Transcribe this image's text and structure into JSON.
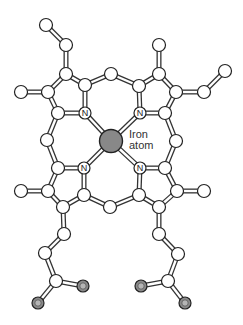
{
  "labels": {
    "iron_line1": "Iron",
    "iron_line2": "atom",
    "nitrogen": "N"
  },
  "colors": {
    "bond_outline": "#333333",
    "bond_fill": "#ffffff",
    "atom_fill": "#ffffff",
    "atom_stroke": "#222222",
    "iron_fill": "#888888",
    "oxygen_fill": "#8a8a8a",
    "oxygen_inner": "#b5b5b5"
  },
  "atoms": [
    {
      "id": "a1",
      "x": 46,
      "y": 25,
      "type": "C"
    },
    {
      "id": "a2",
      "x": 66,
      "y": 45,
      "type": "C"
    },
    {
      "id": "a3",
      "x": 66,
      "y": 74,
      "type": "C"
    },
    {
      "id": "a4",
      "x": 21,
      "y": 92,
      "type": "C"
    },
    {
      "id": "a5",
      "x": 48,
      "y": 92,
      "type": "C"
    },
    {
      "id": "a6",
      "x": 85,
      "y": 85,
      "type": "C"
    },
    {
      "id": "a7",
      "x": 111,
      "y": 74,
      "type": "C"
    },
    {
      "id": "a8",
      "x": 159,
      "y": 45,
      "type": "C"
    },
    {
      "id": "a9",
      "x": 159,
      "y": 74,
      "type": "C"
    },
    {
      "id": "a10",
      "x": 139,
      "y": 86,
      "type": "C"
    },
    {
      "id": "a11",
      "x": 176,
      "y": 92,
      "type": "C"
    },
    {
      "id": "a12",
      "x": 204,
      "y": 92,
      "type": "C"
    },
    {
      "id": "a13",
      "x": 225,
      "y": 71,
      "type": "C"
    },
    {
      "id": "n1",
      "x": 85,
      "y": 113,
      "type": "N"
    },
    {
      "id": "n2",
      "x": 140,
      "y": 113,
      "type": "N"
    },
    {
      "id": "n3",
      "x": 84,
      "y": 168,
      "type": "N"
    },
    {
      "id": "n4",
      "x": 140,
      "y": 168,
      "type": "N"
    },
    {
      "id": "a14",
      "x": 58,
      "y": 113,
      "type": "C"
    },
    {
      "id": "a15",
      "x": 47,
      "y": 140,
      "type": "C"
    },
    {
      "id": "a16",
      "x": 58,
      "y": 168,
      "type": "C"
    },
    {
      "id": "a17",
      "x": 165,
      "y": 113,
      "type": "C"
    },
    {
      "id": "a18",
      "x": 176,
      "y": 141,
      "type": "C"
    },
    {
      "id": "a19",
      "x": 165,
      "y": 168,
      "type": "C"
    },
    {
      "id": "fe",
      "x": 111,
      "y": 141,
      "type": "Fe"
    },
    {
      "id": "a20",
      "x": 21,
      "y": 191,
      "type": "C"
    },
    {
      "id": "a21",
      "x": 48,
      "y": 191,
      "type": "C"
    },
    {
      "id": "a22",
      "x": 84,
      "y": 195,
      "type": "C"
    },
    {
      "id": "a23",
      "x": 63,
      "y": 207,
      "type": "C"
    },
    {
      "id": "a24",
      "x": 110,
      "y": 207,
      "type": "C"
    },
    {
      "id": "a25",
      "x": 139,
      "y": 195,
      "type": "C"
    },
    {
      "id": "a26",
      "x": 159,
      "y": 207,
      "type": "C"
    },
    {
      "id": "a27",
      "x": 177,
      "y": 191,
      "type": "C"
    },
    {
      "id": "a28",
      "x": 204,
      "y": 191,
      "type": "C"
    },
    {
      "id": "a29",
      "x": 64,
      "y": 234,
      "type": "C"
    },
    {
      "id": "a30",
      "x": 45,
      "y": 253,
      "type": "C"
    },
    {
      "id": "a31",
      "x": 56,
      "y": 281,
      "type": "C"
    },
    {
      "id": "o1",
      "x": 83,
      "y": 286,
      "type": "O"
    },
    {
      "id": "o2",
      "x": 38,
      "y": 303,
      "type": "O"
    },
    {
      "id": "a32",
      "x": 159,
      "y": 234,
      "type": "C"
    },
    {
      "id": "a33",
      "x": 178,
      "y": 254,
      "type": "C"
    },
    {
      "id": "a34",
      "x": 168,
      "y": 281,
      "type": "C"
    },
    {
      "id": "o3",
      "x": 141,
      "y": 286,
      "type": "O"
    },
    {
      "id": "o4",
      "x": 185,
      "y": 303,
      "type": "O"
    }
  ],
  "bonds": [
    [
      "a1",
      "a2"
    ],
    [
      "a2",
      "a3"
    ],
    [
      "a3",
      "a5"
    ],
    [
      "a4",
      "a5"
    ],
    [
      "a3",
      "a6"
    ],
    [
      "a6",
      "a7"
    ],
    [
      "a7",
      "a10"
    ],
    [
      "a10",
      "a9"
    ],
    [
      "a8",
      "a9"
    ],
    [
      "a9",
      "a11"
    ],
    [
      "a11",
      "a12"
    ],
    [
      "a12",
      "a13"
    ],
    [
      "a6",
      "n1"
    ],
    [
      "a5",
      "a14"
    ],
    [
      "a14",
      "n1"
    ],
    [
      "a14",
      "a15"
    ],
    [
      "a15",
      "a16"
    ],
    [
      "a16",
      "n3"
    ],
    [
      "a10",
      "n2"
    ],
    [
      "a11",
      "a17"
    ],
    [
      "a17",
      "n2"
    ],
    [
      "a17",
      "a18"
    ],
    [
      "a18",
      "a19"
    ],
    [
      "a19",
      "n4"
    ],
    [
      "n1",
      "fe"
    ],
    [
      "n2",
      "fe"
    ],
    [
      "n3",
      "fe"
    ],
    [
      "n4",
      "fe"
    ],
    [
      "a16",
      "a21"
    ],
    [
      "a20",
      "a21"
    ],
    [
      "a21",
      "a23"
    ],
    [
      "n3",
      "a22"
    ],
    [
      "a22",
      "a23"
    ],
    [
      "a22",
      "a24"
    ],
    [
      "a24",
      "a25"
    ],
    [
      "n4",
      "a25"
    ],
    [
      "a25",
      "a26"
    ],
    [
      "a19",
      "a27"
    ],
    [
      "a26",
      "a27"
    ],
    [
      "a27",
      "a28"
    ],
    [
      "a23",
      "a29"
    ],
    [
      "a29",
      "a30"
    ],
    [
      "a30",
      "a31"
    ],
    [
      "a31",
      "o1"
    ],
    [
      "a31",
      "o2"
    ],
    [
      "a26",
      "a32"
    ],
    [
      "a32",
      "a33"
    ],
    [
      "a33",
      "a34"
    ],
    [
      "a34",
      "o3"
    ],
    [
      "a34",
      "o4"
    ]
  ]
}
